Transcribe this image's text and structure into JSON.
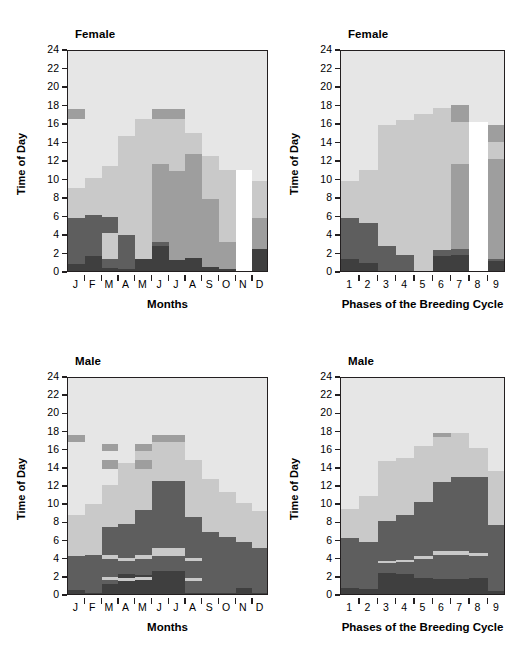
{
  "figure": {
    "width": 531,
    "height": 655,
    "background": "#ffffff"
  },
  "palette": {
    "band1_darkest": "#3f3f3f",
    "band2_dark": "#5e5e5e",
    "band3_midlight": "#9e9e9e",
    "band4_light": "#c9c9c9",
    "band5_lightest": "#e6e6e6",
    "highlight_white": "#ffffff",
    "axis": "#231f20",
    "text": "#000000"
  },
  "axes": {
    "y_label": "Time of Day",
    "y_ticks": [
      "0",
      "2",
      "4",
      "6",
      "8",
      "10",
      "12",
      "14",
      "16",
      "18",
      "20",
      "22",
      "24"
    ],
    "y_min": 0,
    "y_max": 24,
    "x_label_months": "Months",
    "x_label_phases": "Phases of the Breeding Cycle",
    "months": [
      "J",
      "F",
      "M",
      "A",
      "M",
      "J",
      "J",
      "A",
      "S",
      "O",
      "N",
      "D"
    ],
    "phases": [
      "1",
      "2",
      "3",
      "4",
      "5",
      "6",
      "7",
      "8",
      "9"
    ]
  },
  "chart_data": [
    {
      "id": "female-months",
      "type": "area",
      "title": "Female",
      "xlabel": "Months",
      "ylabel": "Time of Day",
      "ylim": [
        0,
        24
      ],
      "grid": false,
      "legend": "none",
      "categories": [
        "J",
        "F",
        "M",
        "A",
        "M",
        "J",
        "J",
        "A",
        "S",
        "O",
        "N",
        "D"
      ],
      "series": [
        {
          "name": "band1_darkest",
          "color": "#3f3f3f",
          "values": [
            1.0,
            1.8,
            0.5,
            0.4,
            1.5,
            2.9,
            1.4,
            1.6,
            0.6,
            0.4,
            0.0,
            2.6
          ]
        },
        {
          "name": "band2_dark",
          "color": "#5e5e5e",
          "values": [
            5.9,
            6.3,
            6.1,
            4.1,
            1.5,
            3.3,
            1.3,
            1.6,
            0.6,
            0.4,
            0.0,
            2.6
          ]
        },
        {
          "name": "band3_midlight",
          "color": "#9e9e9e",
          "values": [
            5.9,
            6.3,
            6.1,
            4.1,
            4.3,
            11.8,
            11.0,
            12.9,
            8.0,
            3.4,
            0.0,
            5.9
          ]
        },
        {
          "name": "band4_light",
          "color": "#c9c9c9",
          "values": [
            9.2,
            10.3,
            11.6,
            14.8,
            16.7,
            17.7,
            17.5,
            15.1,
            12.6,
            11.1,
            11.1,
            10.0
          ]
        },
        {
          "name": "band5_lightest",
          "color": "#e6e6e6",
          "values": [
            24,
            24,
            24,
            24,
            24,
            24,
            24,
            24,
            24,
            24,
            24,
            24
          ]
        }
      ],
      "notes": [
        {
          "category": "M",
          "type": "light-wedge",
          "from": 1.5,
          "to": 4.3,
          "color": "#c9c9c9"
        },
        {
          "category": "J",
          "type": "mid-top",
          "from": 16.7,
          "to": 17.7,
          "color": "#9e9e9e"
        },
        {
          "category": "N",
          "type": "white-column",
          "from": 0,
          "to": 11.1,
          "color": "#ffffff"
        }
      ]
    },
    {
      "id": "female-phases",
      "type": "area",
      "title": "Female",
      "xlabel": "Phases of the Breeding Cycle",
      "ylabel": "Time of Day",
      "ylim": [
        0,
        24
      ],
      "grid": false,
      "legend": "none",
      "categories": [
        "1",
        "2",
        "3",
        "4",
        "5",
        "6",
        "7",
        "8",
        "9"
      ],
      "series": [
        {
          "name": "band1_darkest",
          "color": "#3f3f3f",
          "values": [
            1.5,
            1.1,
            0.0,
            0.0,
            0.25,
            1.8,
            1.9,
            0.0,
            1.3
          ]
        },
        {
          "name": "band2_dark",
          "color": "#5e5e5e",
          "values": [
            5.9,
            5.4,
            2.9,
            2.0,
            0.25,
            2.5,
            2.6,
            0.0,
            1.5
          ]
        },
        {
          "name": "band3_midlight",
          "color": "#9e9e9e",
          "values": [
            5.9,
            5.4,
            2.9,
            2.0,
            0.25,
            2.5,
            11.8,
            0.0,
            12.3
          ]
        },
        {
          "name": "band4_light",
          "color": "#c9c9c9",
          "values": [
            9.9,
            11.1,
            16.0,
            16.5,
            17.2,
            17.8,
            18.2,
            16.3,
            16.0
          ]
        },
        {
          "name": "band5_lightest",
          "color": "#e6e6e6",
          "values": [
            24,
            24,
            24,
            24,
            24,
            24,
            24,
            24,
            24
          ]
        }
      ],
      "notes": [
        {
          "category": "6",
          "type": "light-wedge",
          "from": 2.5,
          "to": 3.8,
          "color": "#c9c9c9"
        },
        {
          "category": "7",
          "type": "mid-top",
          "from": 16.3,
          "to": 18.2,
          "color": "#9e9e9e"
        },
        {
          "category": "8",
          "type": "white-column",
          "from": 0,
          "to": 16.3,
          "color": "#ffffff"
        },
        {
          "category": "9",
          "type": "mid-top",
          "from": 14.2,
          "to": 16.0,
          "color": "#9e9e9e"
        }
      ]
    },
    {
      "id": "male-months",
      "type": "area",
      "title": "Male",
      "xlabel": "Months",
      "ylabel": "Time of Day",
      "ylim": [
        0,
        24
      ],
      "grid": false,
      "legend": "none",
      "categories": [
        "J",
        "F",
        "M",
        "A",
        "M",
        "J",
        "J",
        "A",
        "S",
        "O",
        "N",
        "D"
      ],
      "series": [
        {
          "name": "band1_darkest",
          "color": "#3f3f3f",
          "values": [
            0.7,
            0.35,
            1.3,
            2.4,
            2.3,
            2.8,
            2.7,
            0.3,
            0.3,
            0.3,
            0.9,
            0.3
          ]
        },
        {
          "name": "band2_dark",
          "color": "#5e5e5e",
          "values": [
            5.3,
            4.5,
            7.6,
            7.9,
            9.5,
            12.7,
            12.7,
            8.7,
            7.1,
            6.5,
            6.0,
            5.3
          ]
        },
        {
          "name": "band3_midlight",
          "color": "#9e9e9e",
          "values": [
            5.3,
            4.5,
            7.6,
            7.9,
            9.5,
            12.7,
            12.7,
            8.7,
            7.1,
            6.5,
            6.0,
            5.3
          ]
        },
        {
          "name": "band4_light",
          "color": "#c9c9c9",
          "values": [
            8.9,
            10.1,
            12.2,
            14.6,
            16.3,
            17.7,
            17.4,
            15.0,
            12.9,
            11.4,
            10.2,
            9.4
          ]
        },
        {
          "name": "band5_lightest",
          "color": "#e6e6e6",
          "values": [
            24,
            24,
            24,
            24,
            24,
            24,
            24,
            24,
            24,
            24,
            24,
            24
          ]
        }
      ],
      "notes": [
        {
          "category": "M",
          "type": "light-stripe",
          "from": 1.8,
          "to": 2.1,
          "color": "#c9c9c9"
        },
        {
          "category": "A",
          "type": "light-stripe",
          "from": 3.8,
          "to": 4.2,
          "color": "#c9c9c9"
        },
        {
          "category": "M",
          "type": "light-stripe",
          "from": 4.1,
          "to": 4.5,
          "color": "#c9c9c9"
        },
        {
          "category": "J",
          "type": "light-stripe",
          "from": 4.7,
          "to": 5.3,
          "color": "#c9c9c9"
        },
        {
          "category": "J",
          "type": "light-stripe",
          "from": 4.4,
          "to": 4.8,
          "color": "#c9c9c9"
        },
        {
          "category": "A",
          "type": "light-stripe",
          "from": 1.7,
          "to": 2.0,
          "color": "#c9c9c9"
        },
        {
          "category": "M",
          "type": "mid-top",
          "from": 14.0,
          "to": 15.0,
          "color": "#9e9e9e"
        },
        {
          "category": "M2",
          "type": "mid-top",
          "from": 16.0,
          "to": 16.7,
          "color": "#9e9e9e"
        },
        {
          "category": "J",
          "type": "mid-top",
          "from": 17.0,
          "to": 17.7,
          "color": "#9e9e9e"
        }
      ]
    },
    {
      "id": "male-phases",
      "type": "area",
      "title": "Male",
      "xlabel": "Phases of the Breeding Cycle",
      "ylabel": "Time of Day",
      "ylim": [
        0,
        24
      ],
      "grid": false,
      "legend": "none",
      "categories": [
        "1",
        "2",
        "3",
        "4",
        "5",
        "6",
        "7",
        "8",
        "9"
      ],
      "series": [
        {
          "name": "band1_darkest",
          "color": "#3f3f3f",
          "values": [
            0.9,
            0.8,
            2.5,
            2.4,
            2.0,
            1.9,
            1.9,
            2.0,
            0.6
          ]
        },
        {
          "name": "band2_dark",
          "color": "#5e5e5e",
          "values": [
            6.4,
            5.9,
            8.3,
            8.9,
            10.3,
            12.5,
            13.1,
            13.1,
            7.8
          ]
        },
        {
          "name": "band3_midlight",
          "color": "#9e9e9e",
          "values": [
            6.4,
            5.9,
            8.3,
            8.9,
            10.3,
            12.5,
            13.1,
            13.1,
            7.8
          ]
        },
        {
          "name": "band4_light",
          "color": "#c9c9c9",
          "values": [
            9.6,
            11.0,
            14.9,
            15.2,
            16.5,
            17.9,
            17.9,
            16.3,
            13.8
          ]
        },
        {
          "name": "band5_lightest",
          "color": "#e6e6e6",
          "values": [
            24,
            24,
            24,
            24,
            24,
            24,
            24,
            24,
            24
          ]
        }
      ],
      "notes": [
        {
          "category": "3",
          "type": "light-stripe",
          "from": 3.6,
          "to": 3.9,
          "color": "#c9c9c9"
        },
        {
          "category": "4",
          "type": "light-stripe",
          "from": 3.7,
          "to": 4.0,
          "color": "#c9c9c9"
        },
        {
          "category": "5",
          "type": "light-stripe",
          "from": 4.1,
          "to": 4.4,
          "color": "#c9c9c9"
        },
        {
          "category": "6",
          "type": "light-stripe",
          "from": 4.5,
          "to": 5.0,
          "color": "#c9c9c9"
        },
        {
          "category": "7",
          "type": "light-stripe",
          "from": 4.5,
          "to": 5.0,
          "color": "#c9c9c9"
        },
        {
          "category": "8",
          "type": "light-stripe",
          "from": 4.4,
          "to": 4.7,
          "color": "#c9c9c9"
        },
        {
          "category": "6",
          "type": "mid-top",
          "from": 17.5,
          "to": 17.9,
          "color": "#9e9e9e"
        }
      ]
    }
  ]
}
